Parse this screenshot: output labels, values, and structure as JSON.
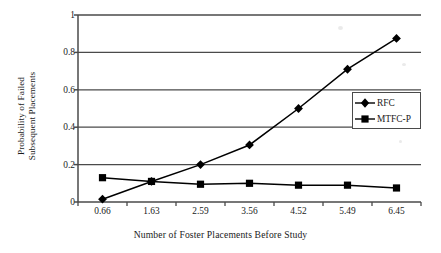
{
  "chart_data": {
    "type": "line",
    "title": "",
    "xlabel": "Number of Foster Placements Before Study",
    "ylabel": "Probability of Failed Subsequent Placements",
    "ylabel_lines": [
      "Probability of Failed",
      "Subsequent Placements"
    ],
    "categories": [
      "0.66",
      "1.63",
      "2.59",
      "3.56",
      "4.52",
      "5.49",
      "6.45"
    ],
    "ylim": [
      0,
      1
    ],
    "yticks": [
      "0",
      "0.2",
      "0.4",
      "0.6",
      "0.8",
      "1"
    ],
    "ytick_values": [
      0,
      0.2,
      0.4,
      0.6,
      0.8,
      1
    ],
    "grid": "horizontal",
    "legend_position": "center-right",
    "series": [
      {
        "name": "RFC",
        "marker": "diamond",
        "color": "#000000",
        "values": [
          0.015,
          0.11,
          0.2,
          0.305,
          0.5,
          0.71,
          0.875
        ]
      },
      {
        "name": "MTFC-P",
        "marker": "square",
        "color": "#000000",
        "values": [
          0.13,
          0.11,
          0.095,
          0.1,
          0.09,
          0.09,
          0.075
        ]
      }
    ]
  },
  "legend": {
    "items": [
      {
        "label": "RFC",
        "marker": "diamond"
      },
      {
        "label": "MTFC-P",
        "marker": "square"
      }
    ]
  },
  "colors": {
    "axis": "#4a4a4a",
    "grid": "#4a4a4a",
    "series": "#000000",
    "background": "#ffffff"
  }
}
